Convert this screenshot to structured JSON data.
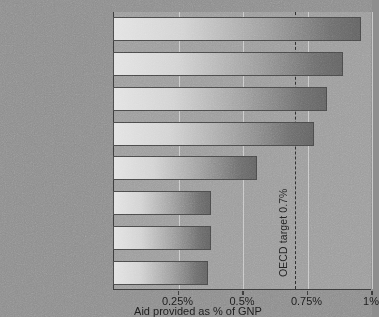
{
  "chart_data": {
    "type": "bar",
    "orientation": "horizontal",
    "title": "",
    "xlabel": "Aid provided as % of GNP",
    "ylabel": "",
    "xlim": [
      0,
      1.0
    ],
    "grid": true,
    "legend": null,
    "categories": [
      "Denmark ($1.6 bn)",
      "Norway ($1.2 bn)",
      "Netherlands ($3.2 bn)",
      "Sweden ($1.7 bn)",
      "France ($8.4 bn)",
      "Canada ($2.1 bn)",
      "Belgium ($1.0 bn)",
      "Australia ($1.2 bn)"
    ],
    "values": [
      0.96,
      0.89,
      0.83,
      0.78,
      0.56,
      0.38,
      0.38,
      0.37
    ],
    "xticks": [
      0.25,
      0.5,
      0.75,
      1.0
    ],
    "xticklabels": [
      "0.25%",
      "0.5%",
      "0.75%",
      "1%"
    ],
    "annotations": [
      {
        "name": "oecd-target",
        "label": "OECD target 0.7%",
        "value": 0.7,
        "style": "dashed-vertical-line"
      }
    ],
    "colors": {
      "background": "#8d8d8d",
      "plot_background": "#9c9c9c",
      "bar_gradient_start": "#e3e3e3",
      "bar_gradient_end": "#636363",
      "gridline": "#c9c9c9",
      "axis": "#3a3a3a",
      "text": "#1b1b1b"
    }
  }
}
